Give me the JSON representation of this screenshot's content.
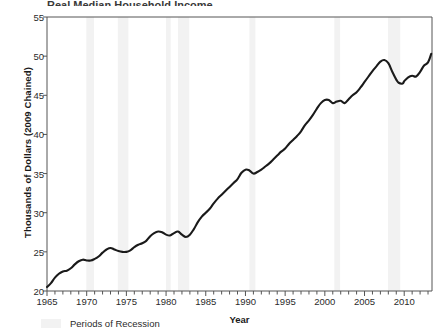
{
  "title_remnant": "Real Median Household Income",
  "axis": {
    "ylabel": "Thousands of Dollars (2009 Chained)",
    "xlabel": "Year"
  },
  "legend": {
    "recession_label": "Periods of Recession",
    "recession_color": "#f2f2f2"
  },
  "colors": {
    "line": "#1a1a1a",
    "axis": "#555555",
    "background": "#ffffff",
    "recession_band": "#f2f2f2"
  },
  "chart_data": {
    "type": "line",
    "title": "Real Median Household Income",
    "xlabel": "Year",
    "ylabel": "Thousands of Dollars (2009 Chained)",
    "xlim": [
      1965,
      2013.5
    ],
    "ylim": [
      20,
      55
    ],
    "ytick_labels": [
      "20",
      "25",
      "30",
      "35",
      "40",
      "45",
      "50",
      "55"
    ],
    "yticks": [
      20,
      25,
      30,
      35,
      40,
      45,
      50,
      55
    ],
    "xtick_labels": [
      "1965",
      "1970",
      "1975",
      "1980",
      "1985",
      "1990",
      "1995",
      "2000",
      "2005",
      "2010"
    ],
    "xticks": [
      1965,
      1970,
      1975,
      1980,
      1985,
      1990,
      1995,
      2000,
      2005,
      2010
    ],
    "minor_xtick_interval": 1,
    "grid": false,
    "legend_position": "below-axis-left",
    "series": [
      {
        "name": "Real Median Household Income",
        "color": "#1a1a1a",
        "x": [
          1965,
          1966,
          1967,
          1968,
          1969,
          1970,
          1971,
          1972,
          1973,
          1974,
          1975,
          1976,
          1977,
          1978,
          1979,
          1980,
          1981,
          1982,
          1983,
          1984,
          1985,
          1986,
          1987,
          1988,
          1989,
          1990,
          1991,
          1992,
          1993,
          1994,
          1995,
          1996,
          1997,
          1998,
          1999,
          2000,
          2001,
          2002,
          2003,
          2004,
          2005,
          2006,
          2007,
          2008,
          2009,
          2010,
          2011,
          2012,
          2013
        ],
        "values": [
          20.5,
          21.4,
          22.0,
          22.6,
          23.1,
          23.2,
          23.3,
          24.2,
          24.7,
          24.5,
          24.4,
          25.0,
          25.4,
          26.4,
          26.7,
          26.2,
          25.9,
          25.8,
          25.9,
          26.8,
          27.5,
          28.7,
          29.1,
          29.5,
          30.3,
          29.9,
          29.1,
          28.9,
          28.9,
          29.5,
          30.3,
          31.0,
          31.9,
          33.2,
          34.1,
          34.4,
          33.9,
          33.7,
          33.7,
          33.8,
          34.1,
          34.6,
          35.2,
          33.8,
          33.4,
          32.7,
          32.2,
          32.3,
          33.0
        ],
        "values_scaled_note": "plotted series in thousands of 2009 chained dollars",
        "plotted": [
          20.5,
          21.4,
          22.0,
          22.6,
          23.1,
          23.2,
          23.3,
          24.2,
          24.7,
          24.5,
          24.4,
          25.0,
          25.4,
          26.4,
          26.7,
          26.2,
          25.9,
          25.8,
          25.9,
          26.8,
          27.5,
          28.7,
          29.1,
          29.5,
          30.3,
          29.9,
          29.1,
          28.9,
          28.9,
          29.5,
          30.3,
          31.0,
          31.9,
          33.2,
          34.1,
          34.4,
          33.9,
          33.7,
          33.7,
          33.8,
          34.1,
          34.6,
          35.2,
          33.8,
          33.4,
          32.7,
          32.2,
          32.3,
          33.0
        ]
      }
    ],
    "points": [
      [
        1965.0,
        20.5
      ],
      [
        1965.5,
        21.0
      ],
      [
        1966.0,
        21.7
      ],
      [
        1966.5,
        22.2
      ],
      [
        1967.0,
        22.5
      ],
      [
        1967.5,
        22.6
      ],
      [
        1968.0,
        22.9
      ],
      [
        1968.5,
        23.4
      ],
      [
        1969.0,
        23.8
      ],
      [
        1969.5,
        24.0
      ],
      [
        1970.0,
        23.9
      ],
      [
        1970.5,
        23.9
      ],
      [
        1971.0,
        24.1
      ],
      [
        1971.5,
        24.4
      ],
      [
        1972.0,
        24.9
      ],
      [
        1972.5,
        25.3
      ],
      [
        1973.0,
        25.5
      ],
      [
        1973.5,
        25.3
      ],
      [
        1974.0,
        25.1
      ],
      [
        1974.5,
        25.0
      ],
      [
        1975.0,
        25.0
      ],
      [
        1975.5,
        25.2
      ],
      [
        1976.0,
        25.6
      ],
      [
        1976.5,
        25.9
      ],
      [
        1977.0,
        26.1
      ],
      [
        1977.5,
        26.4
      ],
      [
        1978.0,
        27.0
      ],
      [
        1978.5,
        27.4
      ],
      [
        1979.0,
        27.6
      ],
      [
        1979.5,
        27.5
      ],
      [
        1980.0,
        27.2
      ],
      [
        1980.5,
        27.1
      ],
      [
        1981.0,
        27.4
      ],
      [
        1981.5,
        27.6
      ],
      [
        1982.0,
        27.2
      ],
      [
        1982.5,
        26.9
      ],
      [
        1983.0,
        27.2
      ],
      [
        1983.5,
        27.9
      ],
      [
        1984.0,
        28.8
      ],
      [
        1984.5,
        29.5
      ],
      [
        1985.0,
        30.0
      ],
      [
        1985.5,
        30.5
      ],
      [
        1986.0,
        31.2
      ],
      [
        1986.5,
        31.8
      ],
      [
        1987.0,
        32.3
      ],
      [
        1987.5,
        32.8
      ],
      [
        1988.0,
        33.3
      ],
      [
        1988.5,
        33.8
      ],
      [
        1989.0,
        34.3
      ],
      [
        1989.5,
        35.1
      ],
      [
        1990.0,
        35.5
      ],
      [
        1990.5,
        35.4
      ],
      [
        1991.0,
        35.0
      ],
      [
        1991.5,
        35.2
      ],
      [
        1992.0,
        35.5
      ],
      [
        1992.5,
        35.9
      ],
      [
        1993.0,
        36.3
      ],
      [
        1993.5,
        36.8
      ],
      [
        1994.0,
        37.3
      ],
      [
        1994.5,
        37.8
      ],
      [
        1995.0,
        38.2
      ],
      [
        1995.5,
        38.8
      ],
      [
        1996.0,
        39.3
      ],
      [
        1996.5,
        39.8
      ],
      [
        1997.0,
        40.4
      ],
      [
        1997.5,
        41.2
      ],
      [
        1998.0,
        41.8
      ],
      [
        1998.5,
        42.5
      ],
      [
        1999.0,
        43.3
      ],
      [
        1999.5,
        44.0
      ],
      [
        2000.0,
        44.4
      ],
      [
        2000.5,
        44.4
      ],
      [
        2001.0,
        44.0
      ],
      [
        2001.5,
        44.2
      ],
      [
        2002.0,
        44.3
      ],
      [
        2002.5,
        44.0
      ],
      [
        2003.0,
        44.5
      ],
      [
        2003.5,
        45.0
      ],
      [
        2004.0,
        45.4
      ],
      [
        2004.5,
        46.0
      ],
      [
        2005.0,
        46.7
      ],
      [
        2005.5,
        47.4
      ],
      [
        2006.0,
        48.1
      ],
      [
        2006.5,
        48.7
      ],
      [
        2007.0,
        49.3
      ],
      [
        2007.5,
        49.5
      ],
      [
        2008.0,
        49.1
      ],
      [
        2008.5,
        48.0
      ],
      [
        2009.0,
        47.0
      ],
      [
        2009.3,
        46.6
      ],
      [
        2009.8,
        46.5
      ],
      [
        2010.0,
        46.8
      ],
      [
        2010.5,
        47.3
      ],
      [
        2011.0,
        47.5
      ],
      [
        2011.5,
        47.4
      ],
      [
        2012.0,
        48.0
      ],
      [
        2012.5,
        48.8
      ],
      [
        2013.0,
        49.2
      ],
      [
        2013.4,
        50.3
      ]
    ],
    "recessions": [
      {
        "start": 1969.95,
        "end": 1970.92
      },
      {
        "start": 1973.92,
        "end": 1975.25
      },
      {
        "start": 1980.0,
        "end": 1980.58
      },
      {
        "start": 1981.5,
        "end": 1982.92
      },
      {
        "start": 1990.5,
        "end": 1991.25
      },
      {
        "start": 2001.2,
        "end": 2001.92
      },
      {
        "start": 2007.95,
        "end": 2009.5
      }
    ]
  }
}
